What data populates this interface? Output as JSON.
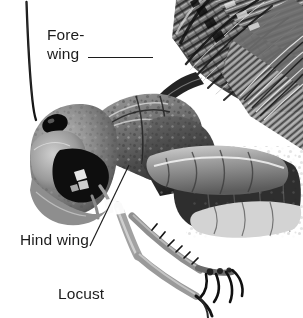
{
  "figure": {
    "subject": "Locust",
    "caption": "Locust",
    "background_color": "#ffffff",
    "ink_color": "#1c1c1c",
    "width": 303,
    "height": 318
  },
  "labels": [
    {
      "id": "forewing",
      "line1": "Fore-",
      "line2": "wing",
      "text": "Fore-wing"
    },
    {
      "id": "hindwing",
      "text": "Hind wing"
    }
  ],
  "photo": {
    "alt": "Black and white photograph of a locust in left side profile",
    "parts": [
      "antenna",
      "head",
      "compound-eye",
      "mouthparts",
      "pronotum",
      "thorax",
      "forewing",
      "hind-wing",
      "fore-leg",
      "mid-leg",
      "hind-leg",
      "tarsal-claw",
      "abdomen"
    ]
  }
}
